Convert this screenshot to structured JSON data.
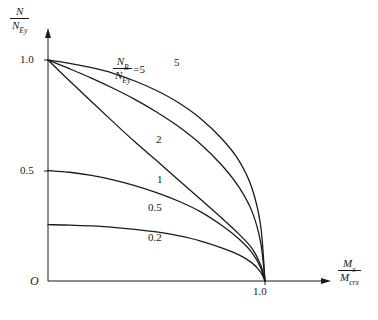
{
  "figure": {
    "kind": "interaction-diagram",
    "background": "#ffffff",
    "ink": "#1a1a1a"
  },
  "axes": {
    "origin_label": "O",
    "y": {
      "title_num": "N",
      "title_den": "N",
      "title_den_sub": "Ey",
      "ticks": [
        "1.0",
        "0.5"
      ],
      "tick_values": [
        1.0,
        0.5
      ],
      "range": [
        0,
        1.08
      ]
    },
    "x": {
      "title_num": "M",
      "title_num_sub": "x",
      "title_den": "M",
      "title_den_sub": "crx",
      "ticks": [
        "1.0"
      ],
      "tick_values": [
        1.0
      ],
      "range": [
        0,
        1.2
      ]
    }
  },
  "annotation": {
    "num": "N",
    "num_sub": "B",
    "den": "N",
    "den_sub": "Ey",
    "equals": "=5"
  },
  "curve_labels": {
    "five": "5",
    "two": "2",
    "one": "1",
    "half": "0.5",
    "fifth": "0.2"
  },
  "chart_data": {
    "type": "line",
    "title": "",
    "xlabel": "Mx / Mcrx",
    "ylabel": "N / NEy",
    "xlim": [
      0,
      1.2
    ],
    "ylim": [
      0,
      1.08
    ],
    "grid": false,
    "legend": "inline-curve-labels",
    "x_ticks": [
      1.0
    ],
    "x_tick_labels": [
      "1.0"
    ],
    "y_ticks": [
      0.5,
      1.0
    ],
    "y_tick_labels": [
      "0.5",
      "1.0"
    ],
    "parameter_name": "NB / NEy",
    "series": [
      {
        "name": "5",
        "parameter": 5,
        "label": "5",
        "y_intercept": 1.0,
        "x_intercept": 1.0,
        "shape": "convex-outward",
        "points": [
          [
            0.0,
            1.0
          ],
          [
            0.1,
            0.985
          ],
          [
            0.2,
            0.965
          ],
          [
            0.3,
            0.94
          ],
          [
            0.4,
            0.905
          ],
          [
            0.5,
            0.862
          ],
          [
            0.6,
            0.808
          ],
          [
            0.7,
            0.738
          ],
          [
            0.8,
            0.645
          ],
          [
            0.88,
            0.545
          ],
          [
            0.94,
            0.42
          ],
          [
            0.98,
            0.25
          ],
          [
            1.0,
            0.0
          ]
        ]
      },
      {
        "name": "2",
        "parameter": 2,
        "label": "2",
        "y_intercept": 1.0,
        "x_intercept": 1.0,
        "shape": "slightly-convex",
        "points": [
          [
            0.0,
            1.0
          ],
          [
            0.1,
            0.96
          ],
          [
            0.2,
            0.918
          ],
          [
            0.3,
            0.872
          ],
          [
            0.4,
            0.822
          ],
          [
            0.5,
            0.765
          ],
          [
            0.6,
            0.7
          ],
          [
            0.7,
            0.622
          ],
          [
            0.8,
            0.525
          ],
          [
            0.88,
            0.425
          ],
          [
            0.94,
            0.315
          ],
          [
            0.98,
            0.175
          ],
          [
            1.0,
            0.0
          ]
        ]
      },
      {
        "name": "1",
        "parameter": 1,
        "label": "1",
        "y_intercept": 1.0,
        "x_intercept": 1.0,
        "shape": "near-linear",
        "points": [
          [
            0.0,
            1.0
          ],
          [
            0.1,
            0.905
          ],
          [
            0.2,
            0.812
          ],
          [
            0.3,
            0.72
          ],
          [
            0.4,
            0.63
          ],
          [
            0.5,
            0.545
          ],
          [
            0.6,
            0.458
          ],
          [
            0.7,
            0.372
          ],
          [
            0.8,
            0.285
          ],
          [
            0.88,
            0.212
          ],
          [
            0.94,
            0.148
          ],
          [
            0.98,
            0.072
          ],
          [
            1.0,
            0.0
          ]
        ]
      },
      {
        "name": "0.5",
        "parameter": 0.5,
        "label": "0.5",
        "y_intercept": 0.5,
        "x_intercept": 1.0,
        "shape": "concave-downward",
        "points": [
          [
            0.0,
            0.5
          ],
          [
            0.1,
            0.492
          ],
          [
            0.2,
            0.478
          ],
          [
            0.3,
            0.458
          ],
          [
            0.4,
            0.432
          ],
          [
            0.5,
            0.4
          ],
          [
            0.6,
            0.362
          ],
          [
            0.7,
            0.315
          ],
          [
            0.8,
            0.252
          ],
          [
            0.88,
            0.19
          ],
          [
            0.94,
            0.128
          ],
          [
            0.98,
            0.06
          ],
          [
            1.0,
            0.0
          ]
        ]
      },
      {
        "name": "0.2",
        "parameter": 0.2,
        "label": "0.2",
        "y_intercept": 0.255,
        "x_intercept": 1.0,
        "shape": "concave-downward",
        "points": [
          [
            0.0,
            0.255
          ],
          [
            0.1,
            0.253
          ],
          [
            0.2,
            0.249
          ],
          [
            0.3,
            0.243
          ],
          [
            0.4,
            0.234
          ],
          [
            0.5,
            0.222
          ],
          [
            0.6,
            0.205
          ],
          [
            0.7,
            0.182
          ],
          [
            0.8,
            0.15
          ],
          [
            0.88,
            0.118
          ],
          [
            0.94,
            0.082
          ],
          [
            0.98,
            0.04
          ],
          [
            1.0,
            0.0
          ]
        ]
      }
    ]
  }
}
